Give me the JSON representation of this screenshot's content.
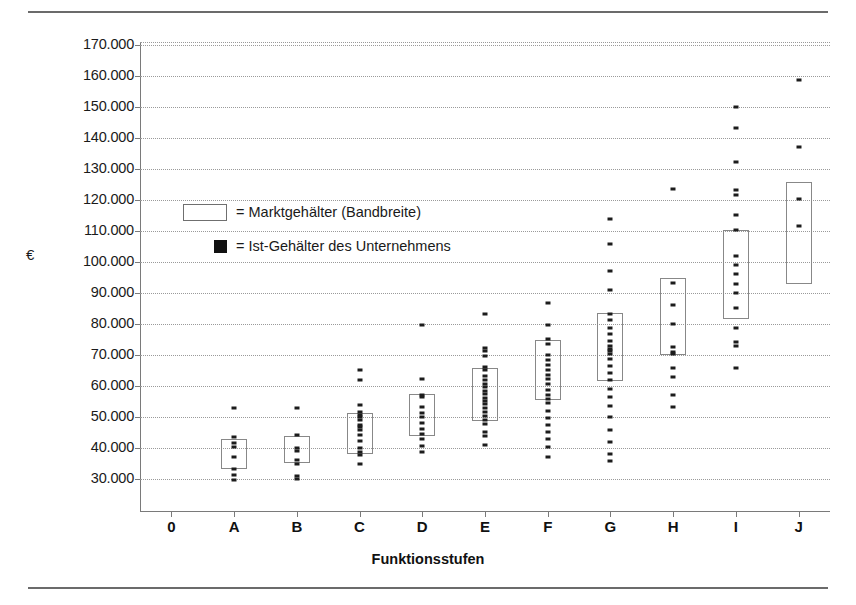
{
  "chart_data": {
    "type": "scatter",
    "title": "",
    "xlabel": "Funktionsstufen",
    "ylabel": "€",
    "ylim": [
      19400,
      171000
    ],
    "ytick_values": [
      30000,
      40000,
      50000,
      60000,
      70000,
      80000,
      90000,
      100000,
      110000,
      120000,
      130000,
      140000,
      150000,
      160000,
      170000
    ],
    "ytick_labels": [
      "30.000",
      "40.000",
      "50.000",
      "60.000",
      "70.000",
      "80.000",
      "90.000",
      "100.000",
      "110.000",
      "120.000",
      "130.000",
      "140.000",
      "150.000",
      "160.000",
      "170.000"
    ],
    "xtick_labels": [
      "0",
      "A",
      "B",
      "C",
      "D",
      "E",
      "F",
      "G",
      "H",
      "I",
      "J"
    ],
    "categories": [
      "A",
      "B",
      "C",
      "D",
      "E",
      "F",
      "G",
      "H",
      "I",
      "J"
    ],
    "grid": true,
    "legend_position": "inside-upper-left",
    "legend": [
      {
        "marker": "band-rectangle",
        "label": "= Marktgehälter (Bandbreite)"
      },
      {
        "marker": "filled-square",
        "label": "= Ist-Gehälter des Unternehmens"
      }
    ],
    "series": [
      {
        "name": "Marktgehälter (Bandbreite)",
        "type": "range-band",
        "bands": [
          {
            "category": "A",
            "low": 33200,
            "high": 43000
          },
          {
            "category": "B",
            "low": 35200,
            "high": 44000
          },
          {
            "category": "C",
            "low": 38200,
            "high": 51200
          },
          {
            "category": "D",
            "low": 44000,
            "high": 57500
          },
          {
            "category": "E",
            "low": 48600,
            "high": 66000
          },
          {
            "category": "F",
            "low": 55600,
            "high": 75000
          },
          {
            "category": "G",
            "low": 61500,
            "high": 83500
          },
          {
            "category": "H",
            "low": 70000,
            "high": 95000
          },
          {
            "category": "I",
            "low": 81500,
            "high": 110500
          },
          {
            "category": "J",
            "low": 93000,
            "high": 126000
          }
        ]
      },
      {
        "name": "Ist-Gehälter des Unternehmens",
        "type": "points",
        "points": [
          {
            "category": "A",
            "values": [
              52800,
              43500,
              41600,
              40300,
              37200,
              33200,
              31200,
              29700
            ]
          },
          {
            "category": "B",
            "values": [
              52900,
              44200,
              40200,
              39200,
              36200,
              34900,
              31000,
              30200
            ]
          },
          {
            "category": "C",
            "values": [
              65300,
              62100,
              54000,
              51800,
              50800,
              50100,
              49200,
              47600,
              46900,
              45800,
              44100,
              42300,
              40200,
              38800,
              37800,
              35000
            ]
          },
          {
            "category": "D",
            "values": [
              79800,
              62300,
              57300,
              56400,
              53300,
              51400,
              49900,
              48100,
              46300,
              44400,
              42800,
              40600,
              38900
            ]
          },
          {
            "category": "E",
            "values": [
              83200,
              72300,
              71200,
              69700,
              66200,
              65200,
              63300,
              61900,
              60800,
              59700,
              58500,
              57600,
              56300,
              55100,
              54100,
              52900,
              51600,
              50400,
              49100,
              47700,
              45300,
              43900,
              41100
            ]
          },
          {
            "category": "F",
            "values": [
              86800,
              79700,
              75200,
              73500,
              70100,
              68400,
              66800,
              65200,
              63700,
              62300,
              60700,
              58800,
              57200,
              55700,
              54400,
              52100,
              49800,
              47500,
              45100,
              42800,
              40500,
              37200
            ]
          },
          {
            "category": "G",
            "values": [
              113800,
              105800,
              97200,
              91100,
              83400,
              81400,
              78700,
              76700,
              74700,
              73100,
              72100,
              71300,
              70300,
              68700,
              66400,
              64100,
              61900,
              59100,
              56400,
              53700,
              50200,
              45800,
              41900,
              38200,
              35800
            ]
          },
          {
            "category": "H",
            "values": [
              123500,
              93300,
              86200,
              80100,
              72600,
              71000,
              70300,
              65900,
              62900,
              57200,
              53200
            ]
          },
          {
            "category": "I",
            "values": [
              150100,
              143100,
              132200,
              123400,
              121700,
              115300,
              110500,
              102000,
              99200,
              96100,
              93100,
              90200,
              85300,
              78900,
              74300,
              73100,
              65700
            ]
          },
          {
            "category": "J",
            "values": [
              158800,
              137100,
              120200,
              111600
            ]
          }
        ]
      }
    ]
  },
  "figure": {
    "top_rule": true,
    "bottom_rule": true
  }
}
